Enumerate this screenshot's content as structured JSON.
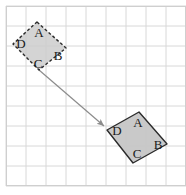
{
  "figure": {
    "width": 186,
    "height": 195,
    "background_color": "#ffffff",
    "grid": {
      "line_color": "#d8d8d8",
      "border_color": "#cfcfcf",
      "cell_size": 20,
      "origin_x": 6,
      "origin_y": 6,
      "columns": 9,
      "rows": 9
    },
    "shapes": [
      {
        "id": "preimage",
        "name": "quadrilateral-abcd-preimage",
        "stroke_style": "dashed",
        "stroke_color": "#2b2b2b",
        "fill_color": "#cccccc",
        "fill_opacity": 0.85,
        "points": "37,22 66,48 39,70 13,44",
        "vertices": [
          {
            "label": "A",
            "x": 39,
            "y": 34
          },
          {
            "label": "B",
            "x": 58,
            "y": 57
          },
          {
            "label": "C",
            "x": 38,
            "y": 65
          },
          {
            "label": "D",
            "x": 21,
            "y": 45
          }
        ]
      },
      {
        "id": "image",
        "name": "quadrilateral-abcd-image",
        "stroke_style": "solid",
        "stroke_color": "#2b2b2b",
        "fill_color": "#c6c6c6",
        "fill_opacity": 0.95,
        "points": "139,112 167,144 133,163 107,130",
        "vertices": [
          {
            "label": "A",
            "x": 138,
            "y": 124
          },
          {
            "label": "B",
            "x": 158,
            "y": 146
          },
          {
            "label": "C",
            "x": 137,
            "y": 155
          },
          {
            "label": "D",
            "x": 117,
            "y": 132
          }
        ]
      }
    ],
    "arrow": {
      "name": "translation-vector-arrow",
      "color": "#8c8c8c",
      "start_x": 39,
      "start_y": 70,
      "end_x": 104,
      "end_y": 126
    }
  }
}
